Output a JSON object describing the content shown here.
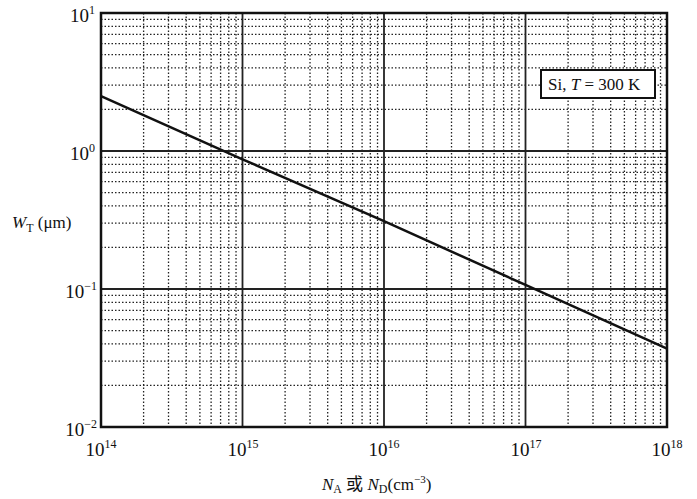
{
  "chart_data": {
    "type": "line",
    "title": "",
    "xlabel": "N_A 或 N_D (cm^-3)",
    "ylabel": "W_T (μm)",
    "xscale": "log",
    "yscale": "log",
    "xlim": [
      100000000000000.0,
      1e+18
    ],
    "ylim": [
      0.01,
      10
    ],
    "grid": true,
    "x_tick_labels": [
      "10^14",
      "10^15",
      "10^16",
      "10^17",
      "10^18"
    ],
    "y_tick_labels": [
      "10^-2",
      "10^-1",
      "10^0",
      "10^1"
    ],
    "legend": {
      "text": "Si, T = 300 K",
      "position": "upper right"
    },
    "series": [
      {
        "name": "Si, T = 300 K",
        "x": [
          100000000000000.0,
          1000000000000000.0,
          1e+16,
          1e+17,
          1e+18
        ],
        "y": [
          2.5,
          0.87,
          0.31,
          0.107,
          0.037
        ]
      }
    ]
  },
  "labels": {
    "x_ticks": [
      {
        "base": "10",
        "exp": "14"
      },
      {
        "base": "10",
        "exp": "15"
      },
      {
        "base": "10",
        "exp": "16"
      },
      {
        "base": "10",
        "exp": "17"
      },
      {
        "base": "10",
        "exp": "18"
      }
    ],
    "y_ticks": [
      {
        "base": "10",
        "exp": "1"
      },
      {
        "base": "10",
        "exp": "0"
      },
      {
        "base": "10",
        "exp": "−1"
      },
      {
        "base": "10",
        "exp": "−2"
      }
    ],
    "xlabel": {
      "n1": "N",
      "s1": "A",
      "mid": " 或 ",
      "n2": "N",
      "s2": "D",
      "unit": "(cm",
      "unit_exp": "−3",
      "close": ")"
    },
    "ylabel": {
      "w": "W",
      "sub": "T",
      "unit": " (μm)"
    },
    "legend": {
      "pre": "Si, ",
      "t": "T",
      "post": " = 300 K"
    }
  }
}
